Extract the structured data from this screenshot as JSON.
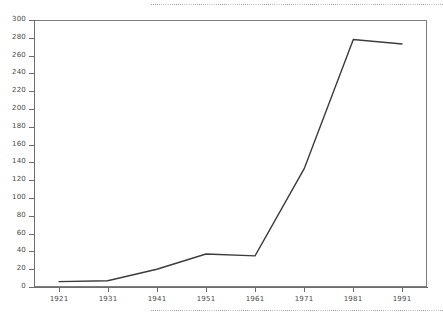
{
  "chart_data": {
    "type": "line",
    "title": "",
    "subtitle": "",
    "xlabel": "",
    "ylabel": "",
    "x": [
      1921,
      1931,
      1941,
      1951,
      1961,
      1971,
      1981,
      1991
    ],
    "categories": [
      "1921",
      "1931",
      "1941",
      "1951",
      "1961",
      "1971",
      "1981",
      "1991"
    ],
    "series": [
      {
        "name": "series-1",
        "values": [
          6,
          7,
          20,
          37,
          35,
          133,
          278,
          273
        ]
      }
    ],
    "values": [
      6,
      7,
      20,
      37,
      35,
      133,
      278,
      273
    ],
    "xlim": [
      1916,
      1996
    ],
    "ylim": [
      0,
      300
    ],
    "ytick_step": 20,
    "yticks": [
      0,
      20,
      40,
      60,
      80,
      100,
      120,
      140,
      160,
      180,
      200,
      220,
      240,
      260,
      280,
      300
    ],
    "ytick_labels": [
      "0",
      "20",
      "40",
      "60",
      "80",
      "100",
      "120",
      "140",
      "160",
      "180",
      "200",
      "220",
      "240",
      "260",
      "280",
      "300"
    ],
    "xticks": [
      1921,
      1931,
      1941,
      1951,
      1961,
      1971,
      1981,
      1991
    ],
    "xtick_labels": [
      "1921",
      "1931",
      "1941",
      "1951",
      "1961",
      "1971",
      "1981",
      "1991"
    ],
    "grid": false,
    "legend": "none",
    "line_color": "#3b3b3b",
    "axis_color": "#6d6d6d",
    "frame_color": "#7d7d7d",
    "background_color": "#ffffff",
    "annotations": []
  },
  "decorations": {
    "dotted_rule_top": "dotted-rule",
    "dotted_rule_bottom": "dotted-rule"
  }
}
